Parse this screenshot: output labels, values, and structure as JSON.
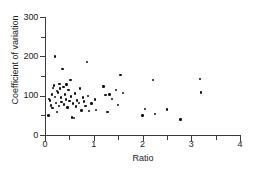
{
  "chart_data": {
    "type": "scatter",
    "title": "",
    "xlabel": "Ratio",
    "ylabel": "Coefficient of variation",
    "xlim": [
      0,
      4
    ],
    "ylim": [
      0,
      300
    ],
    "xticks": [
      0,
      1,
      2,
      3,
      4
    ],
    "xtick_labels": [
      "0",
      "1",
      "2",
      "3",
      "4"
    ],
    "xminorticks": [
      0.5,
      1.5,
      2.5,
      3.5
    ],
    "yticks": [
      0,
      100,
      200,
      300
    ],
    "ytick_labels": [
      "0",
      "100",
      "200",
      "300"
    ],
    "yminorticks": [
      50,
      150,
      250
    ],
    "grid": false,
    "legend": null,
    "marker": "filled-circle",
    "marker_color": "#111111",
    "points": [
      {
        "x": 0.07,
        "y": 50
      },
      {
        "x": 0.08,
        "y": 92
      },
      {
        "x": 0.1,
        "y": 88
      },
      {
        "x": 0.12,
        "y": 75
      },
      {
        "x": 0.14,
        "y": 103
      },
      {
        "x": 0.15,
        "y": 68
      },
      {
        "x": 0.17,
        "y": 120
      },
      {
        "x": 0.18,
        "y": 126
      },
      {
        "x": 0.2,
        "y": 200
      },
      {
        "x": 0.21,
        "y": 97
      },
      {
        "x": 0.22,
        "y": 82
      },
      {
        "x": 0.24,
        "y": 58
      },
      {
        "x": 0.25,
        "y": 112
      },
      {
        "x": 0.27,
        "y": 108
      },
      {
        "x": 0.29,
        "y": 73
      },
      {
        "x": 0.3,
        "y": 130
      },
      {
        "x": 0.31,
        "y": 118
      },
      {
        "x": 0.33,
        "y": 95
      },
      {
        "x": 0.34,
        "y": 84
      },
      {
        "x": 0.36,
        "y": 168
      },
      {
        "x": 0.38,
        "y": 122
      },
      {
        "x": 0.39,
        "y": 78
      },
      {
        "x": 0.41,
        "y": 103
      },
      {
        "x": 0.43,
        "y": 90
      },
      {
        "x": 0.44,
        "y": 128
      },
      {
        "x": 0.46,
        "y": 70
      },
      {
        "x": 0.48,
        "y": 115
      },
      {
        "x": 0.5,
        "y": 86
      },
      {
        "x": 0.52,
        "y": 140
      },
      {
        "x": 0.53,
        "y": 98
      },
      {
        "x": 0.55,
        "y": 45
      },
      {
        "x": 0.58,
        "y": 80
      },
      {
        "x": 0.6,
        "y": 44
      },
      {
        "x": 0.62,
        "y": 106
      },
      {
        "x": 0.64,
        "y": 72
      },
      {
        "x": 0.66,
        "y": 88
      },
      {
        "x": 0.7,
        "y": 82
      },
      {
        "x": 0.72,
        "y": 118
      },
      {
        "x": 0.75,
        "y": 62
      },
      {
        "x": 0.78,
        "y": 95
      },
      {
        "x": 0.8,
        "y": 85
      },
      {
        "x": 0.83,
        "y": 74
      },
      {
        "x": 0.86,
        "y": 186
      },
      {
        "x": 0.88,
        "y": 99
      },
      {
        "x": 0.9,
        "y": 61
      },
      {
        "x": 0.95,
        "y": 80
      },
      {
        "x": 1.02,
        "y": 90
      },
      {
        "x": 1.05,
        "y": 64
      },
      {
        "x": 1.2,
        "y": 123
      },
      {
        "x": 1.24,
        "y": 101
      },
      {
        "x": 1.28,
        "y": 58
      },
      {
        "x": 1.32,
        "y": 103
      },
      {
        "x": 1.38,
        "y": 92
      },
      {
        "x": 1.45,
        "y": 115
      },
      {
        "x": 1.5,
        "y": 77
      },
      {
        "x": 1.55,
        "y": 153
      },
      {
        "x": 1.6,
        "y": 107
      },
      {
        "x": 2.0,
        "y": 50
      },
      {
        "x": 2.05,
        "y": 66
      },
      {
        "x": 2.22,
        "y": 140
      },
      {
        "x": 2.25,
        "y": 54
      },
      {
        "x": 2.5,
        "y": 65
      },
      {
        "x": 2.78,
        "y": 39
      },
      {
        "x": 3.18,
        "y": 143
      },
      {
        "x": 3.2,
        "y": 108
      }
    ]
  }
}
